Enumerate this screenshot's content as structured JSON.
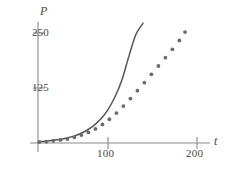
{
  "chart_data": {
    "type": "line",
    "title": "",
    "xlabel": "t",
    "ylabel": "P",
    "xlim": [
      0,
      232
    ],
    "ylim": [
      0,
      325
    ],
    "grid": false,
    "legend": "none",
    "xticks": [
      100,
      200
    ],
    "yticks": [
      125,
      250
    ],
    "xtick_labels": [
      "100",
      "200"
    ],
    "ytick_labels": [
      "125",
      "250"
    ],
    "axis_labels": {
      "x": "t",
      "y": "P"
    },
    "series": [
      {
        "name": "exponential-curve",
        "style": "solid-line",
        "color": "#555555",
        "x": [
          0,
          10,
          20,
          30,
          40,
          50,
          60,
          70,
          80,
          90,
          100,
          110,
          120,
          130,
          140,
          150
        ],
        "y": [
          3,
          4,
          6,
          8,
          11,
          15,
          21,
          29,
          40,
          55,
          76,
          105,
          144,
          198,
          247,
          272
        ]
      },
      {
        "name": "logistic-points",
        "style": "dotted-markers",
        "color": "#6b6b6b",
        "x": [
          2,
          12,
          22,
          32,
          42,
          52,
          62,
          72,
          82,
          92,
          102,
          112,
          122,
          132,
          142,
          152,
          162,
          172,
          182,
          192,
          202,
          210
        ],
        "y": [
          2,
          3,
          5,
          7,
          9,
          13,
          18,
          24,
          32,
          42,
          54,
          68,
          84,
          101,
          119,
          137,
          156,
          175,
          194,
          213,
          233,
          252
        ]
      }
    ]
  },
  "geometry": {
    "origin_x": 38,
    "origin_y": 143,
    "x_scale": 0.7,
    "y_scale": 0.44,
    "axis_color": "#8a8a8a",
    "curve_color": "#555555",
    "dot_color": "#6b6b6b",
    "dot_radius": 1.9
  }
}
